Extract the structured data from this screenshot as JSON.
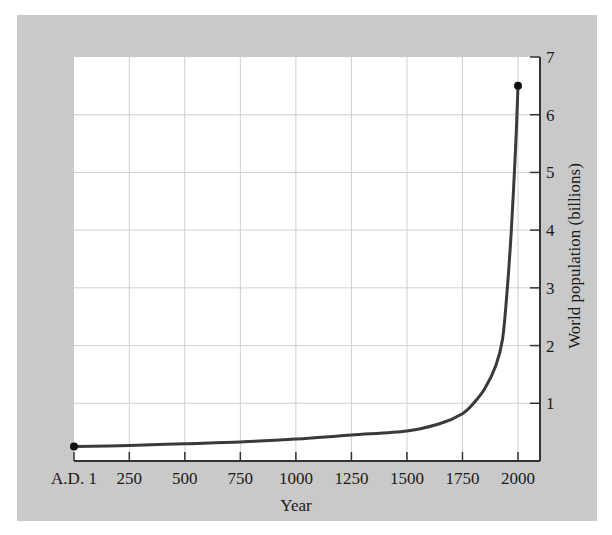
{
  "chart_data": {
    "type": "line",
    "title": "",
    "xlabel": "Year",
    "ylabel": "World population (billions)",
    "x_tick_labels": [
      "A.D. 1",
      "250",
      "500",
      "750",
      "1000",
      "1250",
      "1500",
      "1750",
      "2000"
    ],
    "x_ticks": [
      1,
      250,
      500,
      750,
      1000,
      1250,
      1500,
      1750,
      2000
    ],
    "y_ticks": [
      1,
      2,
      3,
      4,
      5,
      6,
      7
    ],
    "xlim": [
      1,
      2100
    ],
    "ylim": [
      0,
      7
    ],
    "grid": true,
    "y_axis_position": "right",
    "series": [
      {
        "name": "World population",
        "x": [
          1,
          250,
          500,
          750,
          1000,
          1250,
          1500,
          1650,
          1750,
          1800,
          1850,
          1900,
          1930,
          1950,
          1970,
          1990,
          2000
        ],
        "values": [
          0.25,
          0.27,
          0.3,
          0.33,
          0.38,
          0.45,
          0.52,
          0.65,
          0.82,
          1.0,
          1.25,
          1.65,
          2.1,
          2.9,
          4.0,
          5.5,
          6.5
        ]
      }
    ],
    "markers": [
      {
        "x": 1,
        "y": 0.25
      },
      {
        "x": 2000,
        "y": 6.5
      }
    ]
  },
  "axes": {
    "x_title": "Year",
    "y_title": "World population (billions)"
  },
  "colors": {
    "panel_background": "#c9c9c9",
    "plot_background": "#ffffff",
    "curve": "#3a3a3a",
    "grid": "#cfcfcf"
  }
}
